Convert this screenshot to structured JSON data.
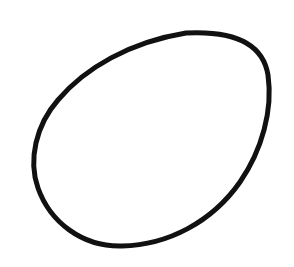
{
  "drawing": {
    "subject": "hand-drawn egg outline",
    "background_color": "#ffffff",
    "stroke_color": "#111111",
    "stroke_width": 5,
    "path": "M 186 33 C 225 31, 262 38, 268 75 C 273 110, 262 150, 240 182 C 212 222, 168 245, 122 246 C 82 247, 50 222, 38 188 C 28 160, 36 125, 58 100 C 85 68, 130 42, 186 33 Z"
  }
}
